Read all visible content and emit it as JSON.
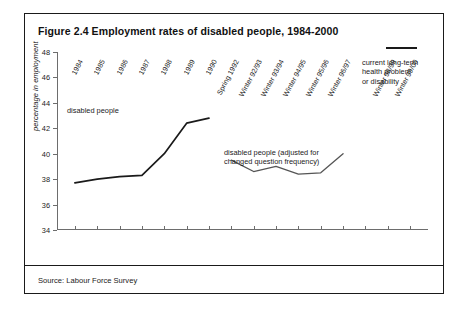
{
  "figure": {
    "title": "Figure 2.4 Employment rates of disabled people, 1984-2000",
    "source": "Source: Labour Force Survey"
  },
  "chart_data": {
    "type": "line",
    "title": "Figure 2.4 Employment rates of disabled people, 1984-2000",
    "xlabel": "",
    "ylabel": "percentage in employment",
    "ylim": [
      34,
      48
    ],
    "ytick_values": [
      34,
      36,
      38,
      40,
      42,
      44,
      46,
      48
    ],
    "ytick_labels": [
      "34",
      "36",
      "38",
      "40",
      "42",
      "44",
      "46",
      "48"
    ],
    "grid": false,
    "legend": "inline-annotations",
    "categories": [
      "1984",
      "1985",
      "1986",
      "1987",
      "1988",
      "1989",
      "1990",
      "Spring 1992",
      "Winter 92/93",
      "Winter 93/94",
      "Winter 94/95",
      "Winter 95/96",
      "Winter 96/97",
      "",
      "Winter 98/99",
      "Winter 99/00"
    ],
    "series": [
      {
        "name": "disabled people",
        "x": [
          "1984",
          "1985",
          "1986",
          "1987",
          "1988",
          "1989",
          "1990"
        ],
        "values": [
          37.7,
          38.0,
          38.2,
          38.3,
          40.0,
          42.4,
          42.8
        ]
      },
      {
        "name": "disabled people (adjusted for changed question frequency)",
        "x": [
          "Spring 1992",
          "Winter 92/93",
          "Winter 93/94",
          "Winter 94/95",
          "Winter 95/96",
          "Winter 96/97"
        ],
        "values": [
          39.5,
          38.6,
          39.0,
          38.4,
          38.5,
          40.0
        ]
      },
      {
        "name": "current long-term health problem or disability",
        "x": [
          "Winter 98/99",
          "Winter 99/00"
        ],
        "values": [
          45.2,
          45.2
        ]
      }
    ],
    "annotations": [
      {
        "text": "disabled people",
        "series": "disabled people"
      },
      {
        "text": "disabled people (adjusted for\nchanged question frequency)",
        "series": "disabled people (adjusted for changed question frequency)"
      },
      {
        "text": "current long-term\nhealth problem\nor disability",
        "series": "current long-term health problem or disability"
      }
    ],
    "colors": {
      "line": "#1a1a1a",
      "axis": "#6d6d6d",
      "background": "#ffffff"
    }
  }
}
